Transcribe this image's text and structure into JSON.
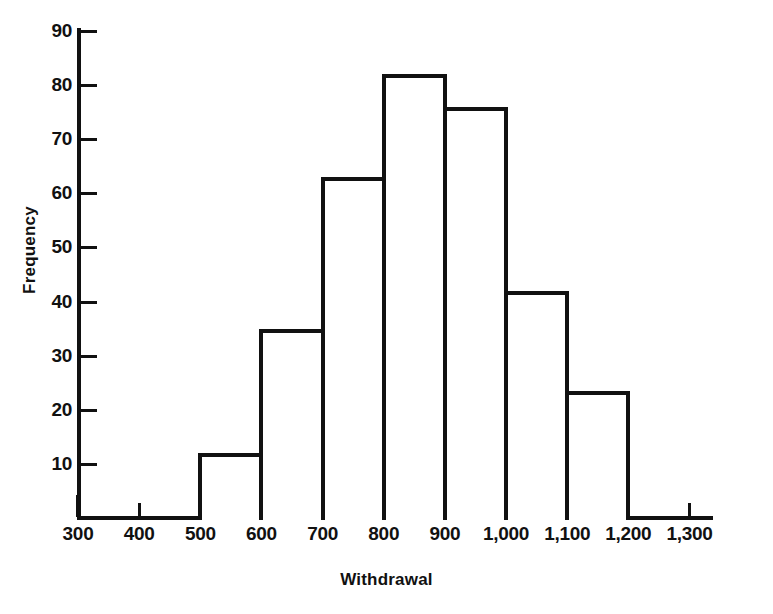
{
  "chart_data": {
    "type": "bar",
    "title": "",
    "xlabel": "Withdrawal",
    "ylabel": "Frequency",
    "xlim": [
      300,
      1300
    ],
    "ylim": [
      0,
      90
    ],
    "grid": false,
    "legend": false,
    "bin_width": 100,
    "bin_edges": [
      500,
      600,
      700,
      800,
      900,
      1000,
      1100,
      1200
    ],
    "categories": [
      "500-600",
      "600-700",
      "700-800",
      "800-900",
      "900-1,000",
      "1,000-1,100",
      "1,100-1,200"
    ],
    "values": [
      12,
      35,
      63,
      82,
      76,
      42,
      23.5
    ],
    "bars": [
      {
        "label": "500-600",
        "start": 500,
        "end": 600,
        "value": 12
      },
      {
        "label": "600-700",
        "start": 600,
        "end": 700,
        "value": 35
      },
      {
        "label": "700-800",
        "start": 700,
        "end": 800,
        "value": 63
      },
      {
        "label": "800-900",
        "start": 800,
        "end": 900,
        "value": 82
      },
      {
        "label": "900-1,000",
        "start": 900,
        "end": 1000,
        "value": 76
      },
      {
        "label": "1,000-1,100",
        "start": 1000,
        "end": 1100,
        "value": 42
      },
      {
        "label": "1,100-1,200",
        "start": 1100,
        "end": 1200,
        "value": 23.5
      }
    ],
    "x_ticks": [
      {
        "value": 300,
        "label": "300",
        "major": true
      },
      {
        "value": 400,
        "label": "400",
        "major": false
      },
      {
        "value": 500,
        "label": "500",
        "major": true
      },
      {
        "value": 600,
        "label": "600",
        "major": true
      },
      {
        "value": 700,
        "label": "700",
        "major": true
      },
      {
        "value": 800,
        "label": "800",
        "major": true
      },
      {
        "value": 900,
        "label": "900",
        "major": true
      },
      {
        "value": 1000,
        "label": "1,000",
        "major": true
      },
      {
        "value": 1100,
        "label": "1,100",
        "major": true
      },
      {
        "value": 1200,
        "label": "1,200",
        "major": true
      },
      {
        "value": 1300,
        "label": "1,300",
        "major": false
      }
    ],
    "y_ticks": [
      {
        "value": 10,
        "label": "10"
      },
      {
        "value": 20,
        "label": "20"
      },
      {
        "value": 30,
        "label": "30"
      },
      {
        "value": 40,
        "label": "40"
      },
      {
        "value": 50,
        "label": "50"
      },
      {
        "value": 60,
        "label": "60"
      },
      {
        "value": 70,
        "label": "70"
      },
      {
        "value": 80,
        "label": "80"
      },
      {
        "value": 90,
        "label": "90"
      }
    ],
    "colors": {
      "background": "#ffffff",
      "axis": "#111111",
      "bar_fill": "#ffffff",
      "bar_outline": "#111111",
      "text": "#111111"
    }
  }
}
